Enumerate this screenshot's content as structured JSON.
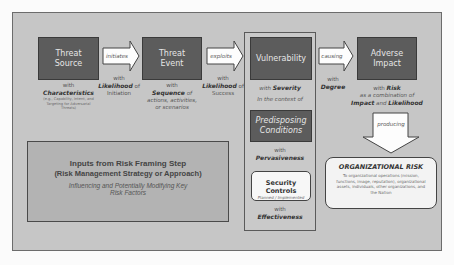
{
  "diagram": {
    "nodes": {
      "threat_source": {
        "line1": "Threat",
        "line2": "Source"
      },
      "threat_event": {
        "line1": "Threat",
        "line2": "Event"
      },
      "vulnerability": {
        "label": "Vulnerability"
      },
      "predisposing": {
        "line1": "Predisposing",
        "line2": "Conditions"
      },
      "adverse_impact": {
        "line1": "Adverse",
        "line2": "Impact"
      }
    },
    "arrows": {
      "initiates": "initiates",
      "exploits": "exploits",
      "causing": "causing",
      "producing": "producing"
    },
    "captions": {
      "source": {
        "with": "with",
        "bold": "Characteristics",
        "note1": "(e.g., Capability, Intent, and",
        "note2": "Targeting for Adversarial",
        "note3": "Threats)"
      },
      "initiates": {
        "with": "with",
        "bold": "Likelihood",
        "rest": " of",
        "line3": "Initiation"
      },
      "event": {
        "with": "with",
        "bold": "Sequence",
        "rest": " of",
        "line3": "actions, activities,",
        "line4": "or scenarios"
      },
      "exploits": {
        "with": "with",
        "bold": "Likelihood",
        "rest": " of",
        "line3": "Success"
      },
      "vulnerability": {
        "with": "with ",
        "bold": "Severity",
        "context": "In the context of"
      },
      "predisposing": {
        "with": "with",
        "bold": "Pervasiveness"
      },
      "security": {
        "with": "with",
        "bold": "Effectiveness"
      },
      "causing": {
        "with": "with",
        "bold": "Degree"
      },
      "impact": {
        "with": "with ",
        "bold": "Risk",
        "line2": "as a combination of",
        "bold2": "Impact",
        "and": " and ",
        "bold3": "Likelihood"
      }
    },
    "security_controls": {
      "title": "Security Controls",
      "subtitle": "Planned / Implemented"
    },
    "org_risk": {
      "title": "ORGANIZATIONAL RISK",
      "line1": "To organizational operations (mission,",
      "line2": "functions, image, reputation), organizational",
      "line3": "assets, individuals, other organizations, and",
      "line4": "the Nation"
    },
    "inputs": {
      "title": "Inputs from Risk Framing Step",
      "subtitle": "(Risk Management Strategy or Approach)",
      "italic1": "Influencing and Potentially Modifying Key",
      "italic2": "Risk Factors"
    }
  }
}
